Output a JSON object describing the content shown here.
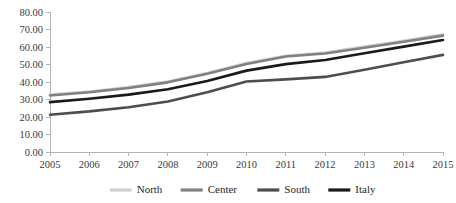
{
  "chart_data": {
    "type": "line",
    "title": "",
    "subtitle": "",
    "xlabel": "",
    "ylabel": "",
    "categories": [
      "2005",
      "2006",
      "2007",
      "2008",
      "2009",
      "2010",
      "2011",
      "2012",
      "2013",
      "2014",
      "2015"
    ],
    "x": [
      2005,
      2006,
      2007,
      2008,
      2009,
      2010,
      2011,
      2012,
      2013,
      2014,
      2015
    ],
    "ylim": [
      0,
      80
    ],
    "ytick_values": [
      0,
      10,
      20,
      30,
      40,
      50,
      60,
      70,
      80
    ],
    "ytick_labels": [
      "0.00",
      "10.00",
      "20.00",
      "30.00",
      "40.00",
      "50.00",
      "60.00",
      "70.00",
      "80.00"
    ],
    "grid": false,
    "legend_position": "bottom",
    "series": [
      {
        "name": "North",
        "color": "#d0d0d0",
        "values": [
          32.8,
          34.6,
          37.1,
          40.3,
          45.2,
          50.8,
          55.0,
          56.8,
          60.2,
          63.6,
          67.2
        ]
      },
      {
        "name": "Center",
        "color": "#808080",
        "values": [
          32.3,
          34.1,
          36.6,
          39.8,
          44.7,
          50.3,
          54.6,
          56.3,
          59.6,
          63.0,
          66.5
        ]
      },
      {
        "name": "South",
        "color": "#4d4d4d",
        "values": [
          21.3,
          23.2,
          25.6,
          28.9,
          34.2,
          40.3,
          41.5,
          42.9,
          47.0,
          51.3,
          55.5
        ]
      },
      {
        "name": "Italy",
        "color": "#1a1a1a",
        "values": [
          28.5,
          30.4,
          32.8,
          35.9,
          40.6,
          46.5,
          50.2,
          52.6,
          56.4,
          60.2,
          64.0
        ]
      }
    ]
  },
  "legend": {
    "items": [
      {
        "label": "North",
        "color": "#d0d0d0"
      },
      {
        "label": "Center",
        "color": "#808080"
      },
      {
        "label": "South",
        "color": "#4d4d4d"
      },
      {
        "label": "Italy",
        "color": "#1a1a1a"
      }
    ]
  },
  "axes": {
    "axis_color": "#b4b4b4",
    "tick_label_color": "#3a3a3a"
  }
}
